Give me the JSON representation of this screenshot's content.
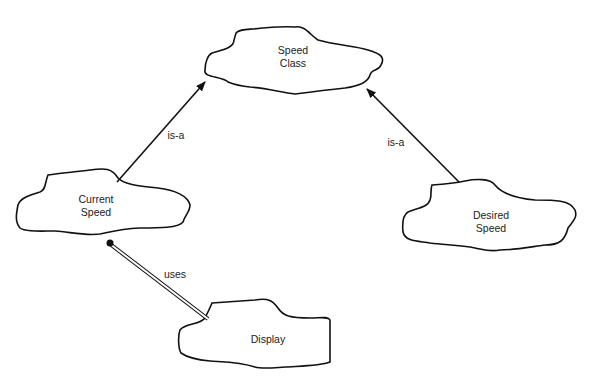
{
  "diagram": {
    "nodes": [
      {
        "id": "speed-class",
        "line1": "Speed",
        "line2": "Class"
      },
      {
        "id": "current-speed",
        "line1": "Current",
        "line2": "Speed"
      },
      {
        "id": "desired-speed",
        "line1": "Desired",
        "line2": "Speed"
      },
      {
        "id": "display",
        "line1": "Display",
        "line2": ""
      }
    ],
    "edges": [
      {
        "from": "current-speed",
        "to": "speed-class",
        "label": "is-a",
        "style": "arrow"
      },
      {
        "from": "desired-speed",
        "to": "speed-class",
        "label": "is-a",
        "style": "arrow"
      },
      {
        "from": "display",
        "to": "current-speed",
        "label": "uses",
        "style": "double-line-dot"
      }
    ],
    "colors": {
      "stroke": "#111111",
      "background": "#ffffff"
    }
  }
}
